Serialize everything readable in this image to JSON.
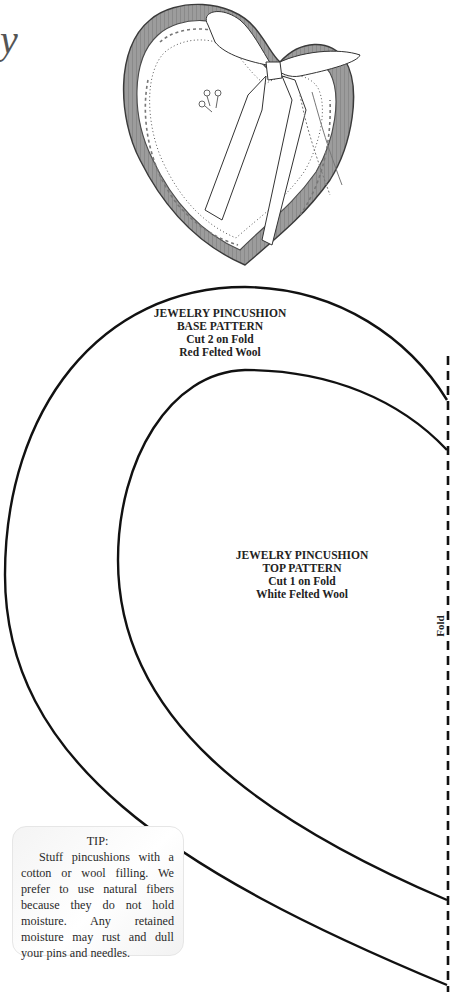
{
  "page": {
    "title_fragment": "y"
  },
  "illustration": {
    "subject": "heart-pincushion-illustration",
    "colors": {
      "felt_base": "#9a9a9a",
      "outline": "#444444",
      "fill": "#ffffff"
    }
  },
  "patterns": {
    "base": {
      "lines": [
        "JEWELRY PINCUSHION",
        "BASE PATTERN",
        "Cut 2 on Fold",
        "Red Felted Wool"
      ]
    },
    "top": {
      "lines": [
        "JEWELRY PINCUSHION",
        "TOP PATTERN",
        "Cut 1 on Fold",
        "White Felted Wool"
      ]
    },
    "fold_label": "Fold"
  },
  "tip": {
    "title": "TIP:",
    "body": "Stuff pincushions with a cotton or wool filling. We prefer to use natural fibers because they do not hold moisture. Any retained moisture may rust and dull your pins and needles."
  }
}
